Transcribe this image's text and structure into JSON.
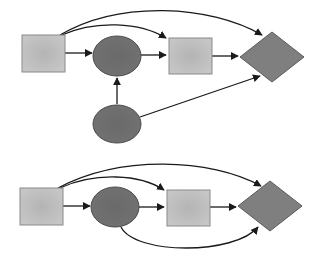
{
  "colors": {
    "background": "#ffffff",
    "square_fill": "#c2c2c2",
    "square_center": "#b4b4b4",
    "square_stroke": "#8a8a8a",
    "ellipse_fill": "#6e6e6e",
    "ellipse_stroke": "#4a4a4a",
    "diamond_fill": "#7f7f7f",
    "diamond_stroke": "#5a5a5a",
    "edge": "#1a1a1a"
  },
  "diagrams": [
    {
      "name": "top-diagram",
      "nodes": [
        {
          "id": "A",
          "shape": "square",
          "x": 22,
          "y": 35,
          "w": 43,
          "h": 37
        },
        {
          "id": "B",
          "shape": "ellipse",
          "cx": 117,
          "cy": 56,
          "rx": 24,
          "ry": 20
        },
        {
          "id": "C",
          "shape": "square",
          "x": 169,
          "y": 38,
          "w": 43,
          "h": 36
        },
        {
          "id": "D",
          "shape": "diamond",
          "cx": 272,
          "cy": 57,
          "hw": 32,
          "hh": 25
        },
        {
          "id": "E",
          "shape": "ellipse",
          "cx": 117,
          "cy": 124,
          "rx": 24,
          "ry": 19
        }
      ],
      "edges": [
        {
          "from": "A",
          "to": "B"
        },
        {
          "from": "B",
          "to": "C"
        },
        {
          "from": "C",
          "to": "D"
        },
        {
          "from": "A",
          "to": "C",
          "curved": true
        },
        {
          "from": "A",
          "to": "D",
          "curved": true
        },
        {
          "from": "E",
          "to": "B"
        },
        {
          "from": "E",
          "to": "D"
        }
      ]
    },
    {
      "name": "bottom-diagram",
      "nodes": [
        {
          "id": "A",
          "shape": "square",
          "x": 20,
          "y": 188,
          "w": 43,
          "h": 37
        },
        {
          "id": "B",
          "shape": "ellipse",
          "cx": 115,
          "cy": 207,
          "rx": 24,
          "ry": 20
        },
        {
          "id": "C",
          "shape": "square",
          "x": 167,
          "y": 190,
          "w": 43,
          "h": 36
        },
        {
          "id": "D",
          "shape": "diamond",
          "cx": 270,
          "cy": 206,
          "hw": 32,
          "hh": 25
        }
      ],
      "edges": [
        {
          "from": "A",
          "to": "B"
        },
        {
          "from": "B",
          "to": "C"
        },
        {
          "from": "C",
          "to": "D"
        },
        {
          "from": "A",
          "to": "C",
          "curved": true
        },
        {
          "from": "A",
          "to": "D",
          "curved": true
        },
        {
          "from": "B",
          "to": "D",
          "curved": true
        }
      ]
    }
  ]
}
